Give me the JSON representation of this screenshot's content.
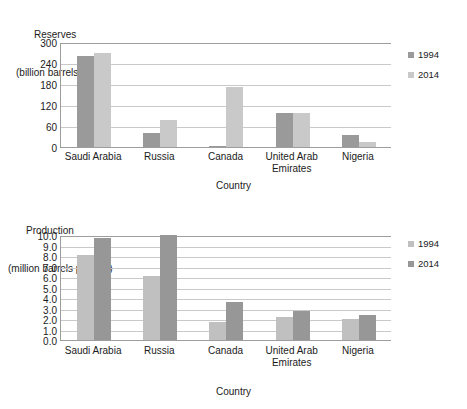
{
  "chart_data": [
    {
      "type": "bar",
      "id": "reserves",
      "title": "",
      "ylabel_line1": "Reserves",
      "ylabel_line2": "(billion barrels)",
      "xlabel": "Country",
      "categories": [
        "Saudi Arabia",
        "Russia",
        "Canada",
        "United Arab Emirates",
        "Nigeria"
      ],
      "category_lines": [
        [
          "Saudi Arabia"
        ],
        [
          "Russia"
        ],
        [
          "Canada"
        ],
        [
          "United Arab",
          "Emirates"
        ],
        [
          "Nigeria"
        ]
      ],
      "series": [
        {
          "name": "1994",
          "color": "#9a9a9a",
          "values": [
            261,
            40,
            3,
            98,
            35
          ]
        },
        {
          "name": "2014",
          "color": "#c9c9c9",
          "values": [
            268,
            77,
            172,
            97,
            14
          ]
        }
      ],
      "ylim": [
        0,
        300
      ],
      "yticks": [
        "0",
        "60",
        "120",
        "180",
        "240",
        "300"
      ],
      "ytick_values": [
        0,
        60,
        120,
        180,
        240,
        300
      ],
      "grid": true,
      "legend_position": "right",
      "legend": [
        "1994",
        "2014"
      ]
    },
    {
      "type": "bar",
      "id": "production",
      "title": "",
      "ylabel_line1": "Production",
      "ylabel_line2": "(million barrels per day)",
      "xlabel": "Country",
      "categories": [
        "Saudi Arabia",
        "Russia",
        "Canada",
        "United Arab Emirates",
        "Nigeria"
      ],
      "category_lines": [
        [
          "Saudi Arabia"
        ],
        [
          "Russia"
        ],
        [
          "Canada"
        ],
        [
          "United Arab",
          "Emirates"
        ],
        [
          "Nigeria"
        ]
      ],
      "series": [
        {
          "name": "1994",
          "color": "#c0c0c0",
          "values": [
            8.1,
            6.1,
            1.7,
            2.2,
            2.0
          ]
        },
        {
          "name": "2014",
          "color": "#979797",
          "values": [
            9.7,
            10.0,
            3.6,
            2.8,
            2.4
          ]
        }
      ],
      "ylim": [
        0,
        10
      ],
      "yticks": [
        "0.0",
        "1.0",
        "2.0",
        "3.0",
        "4.0",
        "5.0",
        "6.0",
        "7.0",
        "8.0",
        "9.0",
        "10.0"
      ],
      "ytick_values": [
        0,
        1,
        2,
        3,
        4,
        5,
        6,
        7,
        8,
        9,
        10
      ],
      "grid": true,
      "legend_position": "right",
      "legend": [
        "1994",
        "2014"
      ]
    }
  ]
}
